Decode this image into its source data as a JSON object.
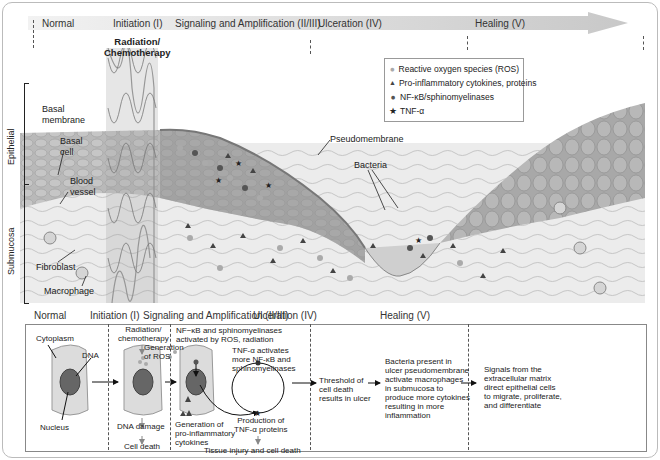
{
  "phases": [
    {
      "label": "Normal"
    },
    {
      "label": "Initiation (I)"
    },
    {
      "label": "Signaling and Amplification (II/III)"
    },
    {
      "label": "Ulceration (IV)"
    },
    {
      "label": "Healing (V)"
    }
  ],
  "tissue": {
    "radiation_label_line1": "Radiation/",
    "radiation_label_line2": "Chemotherapy",
    "side_labels": {
      "epithelial": "Epithelial",
      "submucosa": "Submucosa"
    },
    "annotations": {
      "basal_membrane_1": "Basal",
      "basal_membrane_2": "membrane",
      "basal_cell_1": "Basal",
      "basal_cell_2": "cell",
      "blood_vessel_1": "Blood",
      "blood_vessel_2": "vessel",
      "fibroblast": "Fibroblast",
      "macrophage": "Macrophage",
      "pseudomembrane": "Pseudomembrane",
      "bacteria": "Bacteria"
    }
  },
  "legend": {
    "items": [
      {
        "icon": "light-circle",
        "glyph": "●",
        "color": "#aaaaaa",
        "label": "Reactive oxygen species (ROS)"
      },
      {
        "icon": "triangle",
        "glyph": "▲",
        "color": "#444444",
        "label": "Pro-inflammatory cytokines, proteins"
      },
      {
        "icon": "dark-circle",
        "glyph": "●",
        "color": "#555555",
        "label": "NF-κB/sphinomyelinases"
      },
      {
        "icon": "star",
        "glyph": "★",
        "color": "#222222",
        "label": "TNF-α"
      }
    ]
  },
  "bottom": {
    "headers": [
      "Normal",
      "Initiation (I)",
      "Signaling and Amplification (II/III)",
      "Ulceration (IV)",
      "Healing (V)"
    ],
    "normal": {
      "cytoplasm": "Cytoplasm",
      "dna": "DNA",
      "nucleus": "Nucleus"
    },
    "initiation": {
      "radiation_1": "Radiation/",
      "radiation_2": "chemotherapy",
      "ros_1": "Generation",
      "ros_2": "of ROS",
      "dna_damage": "DNA damage",
      "cell_death": "Cell death"
    },
    "signaling": {
      "nfkb_1": "NF−κB and sphinomyelinases",
      "nfkb_2": "activated by ROS, radiation",
      "tnf_1": "TNF-α activates",
      "tnf_2": "more NF-κB and",
      "tnf_3": "sphinomyelinases",
      "cyto_1": "Generation of",
      "cyto_2": "pro-inflammatory",
      "cyto_3": "cytokines",
      "prod_1": "Production of",
      "prod_2": "TNF-α proteins",
      "tissue_injury": "Tissue injury and cell death"
    },
    "ulceration": {
      "threshold_1": "Threshold of",
      "threshold_2": "cell death",
      "threshold_3": "results in ulcer",
      "bact_1": "Bacteria present in",
      "bact_2": "ulcer pseudomembrane",
      "bact_3": "activate macrophages",
      "bact_4": "in submucosa to",
      "bact_5": "produce more cytokines",
      "bact_6": "resulting in more",
      "bact_7": "inflammation"
    },
    "healing": {
      "l1": "Signals from the",
      "l2": "extracellular matrix",
      "l3": "direct epithelial cells",
      "l4": "to migrate, proliferate,",
      "l5": "and differentiate"
    }
  }
}
